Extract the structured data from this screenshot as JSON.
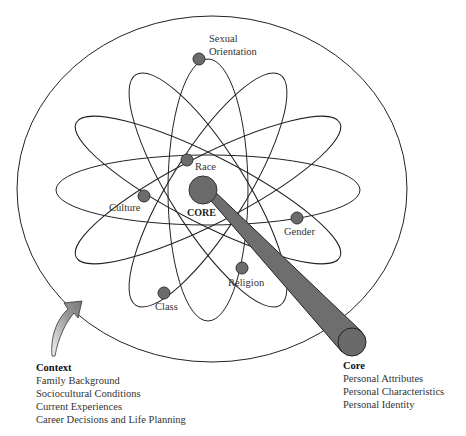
{
  "diagram": {
    "center_label": "CORE",
    "orbit_labels": [
      {
        "id": "sexual-orientation",
        "lines": [
          "Sexual",
          "Orientation"
        ]
      },
      {
        "id": "race",
        "lines": [
          "Race"
        ]
      },
      {
        "id": "culture",
        "lines": [
          "Culture"
        ]
      },
      {
        "id": "gender",
        "lines": [
          "Gender"
        ]
      },
      {
        "id": "religion",
        "lines": [
          "Religion"
        ]
      },
      {
        "id": "class",
        "lines": [
          "Class"
        ]
      }
    ],
    "colors": {
      "node_fill": "#6b6b6b",
      "stroke": "#222222",
      "stick_fill": "#6e6e6e"
    }
  },
  "context": {
    "title": "Context",
    "items": [
      "Family Background",
      "Sociocultural Conditions",
      "Current Experiences",
      "Career Decisions and Life Planning"
    ]
  },
  "core": {
    "title": "Core",
    "items": [
      "Personal Attributes",
      "Personal Characteristics",
      "Personal Identity"
    ]
  }
}
